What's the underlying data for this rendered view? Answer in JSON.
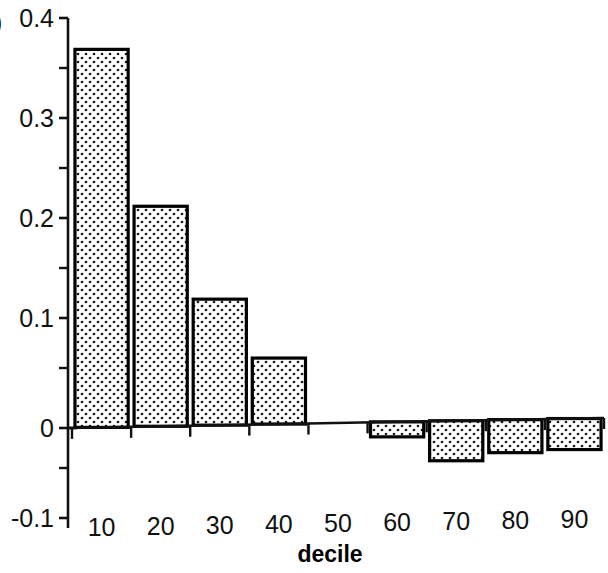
{
  "figure": {
    "panel_label": ")",
    "background_color": "#ffffff",
    "ink_color": "#111111"
  },
  "chart_data": {
    "type": "bar",
    "title": "",
    "subtitle": "",
    "xlabel": "decile",
    "ylabel": "",
    "categories": [
      "10",
      "20",
      "30",
      "40",
      "50",
      "60",
      "70",
      "80",
      "90"
    ],
    "values": [
      0.378,
      0.22,
      0.126,
      0.066,
      0.0,
      -0.015,
      -0.04,
      -0.033,
      -0.031
    ],
    "series": [
      {
        "name": "",
        "values": [
          0.378,
          0.22,
          0.126,
          0.066,
          0.0,
          -0.015,
          -0.04,
          -0.033,
          -0.031
        ]
      }
    ],
    "ylim": [
      -0.1,
      0.4
    ],
    "xlim": [
      0,
      9
    ],
    "ytick_labels": [
      "0.4",
      "0.3",
      "0.2",
      "0.1",
      "0",
      "-0.1"
    ],
    "ytick_values": [
      0.4,
      0.3,
      0.2,
      0.1,
      0,
      -0.1
    ],
    "yminor_tick_values": [
      0.35,
      0.25,
      0.15,
      0.05,
      -0.05
    ],
    "xtick_labels": [
      "10",
      "20",
      "30",
      "40",
      "50",
      "60",
      "70",
      "80",
      "90"
    ],
    "grid": false,
    "legend": false,
    "legend_position": "none",
    "bar_fill_pattern": "dotted-stipple",
    "bar_fill_color": "#ffffff",
    "bar_dot_color": "#1a1a1a",
    "bar_edge_color": "#000000",
    "baseline_value": 0,
    "annotations": []
  }
}
